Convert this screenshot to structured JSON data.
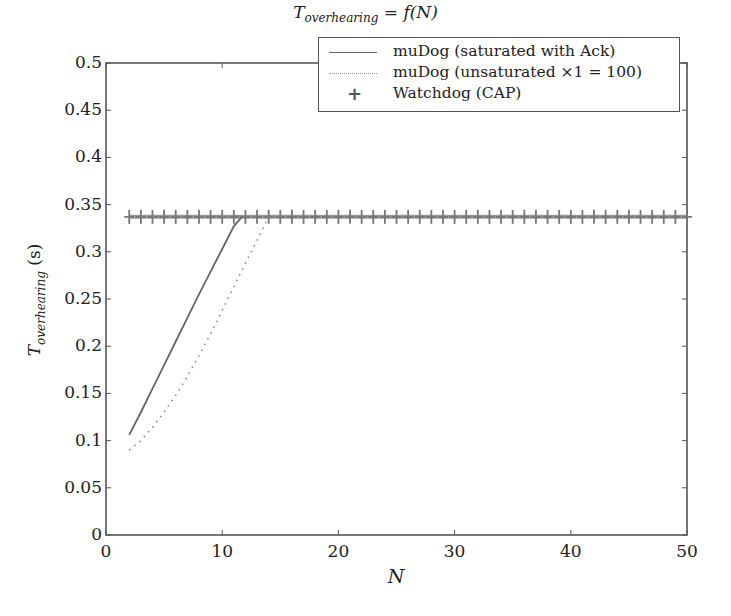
{
  "chart_data": {
    "type": "line",
    "title_parts": {
      "base": "T",
      "sub": "overhearing",
      "rest": " = f(N)"
    },
    "xlabel": "N",
    "ylabel": "T_overhearing (s)",
    "ylabel_parts": {
      "base": "T",
      "sub": "overhearing",
      "rest": " (s)"
    },
    "xlim": [
      0,
      50
    ],
    "ylim": [
      0,
      0.5
    ],
    "xticks": [
      0,
      10,
      20,
      30,
      40,
      50
    ],
    "xtick_labels": [
      "0",
      "10",
      "20",
      "30",
      "40",
      "50"
    ],
    "yticks": [
      0,
      0.05,
      0.1,
      0.15,
      0.2,
      0.25,
      0.3,
      0.35,
      0.4,
      0.45,
      0.5
    ],
    "ytick_labels": [
      "0",
      "0.05",
      "0.1",
      "0.15",
      "0.2",
      "0.25",
      "0.3",
      "0.35",
      "0.4",
      "0.45",
      "0.5"
    ],
    "grid": false,
    "legend_position": "upper right",
    "series": [
      {
        "name": "muDog (saturated with Ack)",
        "style": "solid",
        "x": [
          2,
          3,
          4,
          5,
          6,
          7,
          8,
          9,
          10,
          11,
          11.7
        ],
        "y": [
          0.106,
          0.13,
          0.155,
          0.18,
          0.205,
          0.23,
          0.255,
          0.279,
          0.303,
          0.327,
          0.337
        ]
      },
      {
        "name": "muDog (unsaturated ×1 = 100)",
        "style": "dotted",
        "x": [
          2,
          3,
          4,
          5,
          6,
          7,
          8,
          9,
          10,
          11,
          12,
          13,
          14
        ],
        "y": [
          0.09,
          0.1,
          0.114,
          0.13,
          0.148,
          0.168,
          0.19,
          0.213,
          0.238,
          0.263,
          0.288,
          0.312,
          0.337
        ]
      },
      {
        "name": "Watchdog (CAP)",
        "style": "marker-plus",
        "x": [
          2,
          3,
          4,
          5,
          6,
          7,
          8,
          9,
          10,
          11,
          12,
          13,
          14,
          15,
          16,
          17,
          18,
          19,
          20,
          21,
          22,
          23,
          24,
          25,
          26,
          27,
          28,
          29,
          30,
          31,
          32,
          33,
          34,
          35,
          36,
          37,
          38,
          39,
          40,
          41,
          42,
          43,
          44,
          45,
          46,
          47,
          48,
          49,
          50
        ],
        "y_constant": 0.337
      }
    ]
  },
  "legend": {
    "items": [
      {
        "label": "muDog (saturated with Ack)"
      },
      {
        "label": "muDog (unsaturated ×1 = 100)"
      },
      {
        "label": "Watchdog (CAP)"
      }
    ]
  },
  "colors": {
    "axis": "#555555",
    "solid_line": "#666666",
    "dotted_line": "#888888",
    "watchdog": "#777777"
  }
}
